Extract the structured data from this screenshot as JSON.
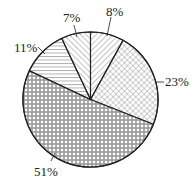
{
  "chart_data": {
    "type": "pie",
    "title": "",
    "start_angle_deg": 0,
    "direction": "clockwise",
    "slices": [
      {
        "label": "8%",
        "value": 8,
        "pattern": "diagonal-forward"
      },
      {
        "label": "23%",
        "value": 23,
        "pattern": "crosshatch"
      },
      {
        "label": "51%",
        "value": 51,
        "pattern": "brick-grid"
      },
      {
        "label": "11%",
        "value": 11,
        "pattern": "horizontal-lines"
      },
      {
        "label": "7%",
        "value": 7,
        "pattern": "diagonal-backward"
      }
    ],
    "categories": [
      "8%",
      "23%",
      "51%",
      "11%",
      "7%"
    ],
    "values": [
      8,
      23,
      51,
      11,
      7
    ],
    "legend": "none",
    "colors": {
      "stroke": "#222222",
      "fill": "#ffffff",
      "hatch": "#444444"
    }
  }
}
